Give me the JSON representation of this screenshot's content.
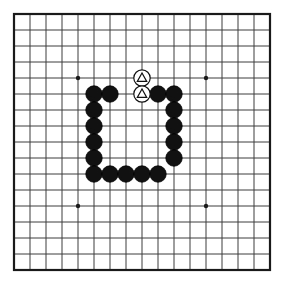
{
  "figure": {
    "kind": "go-board-diagram",
    "background_color": "#ffffff"
  },
  "board": {
    "columns": 17,
    "rows": 17,
    "origin_x": 14,
    "origin_y": 14,
    "spacing": 16,
    "line_color": "#3c3c3c",
    "line_width": 1,
    "border_color": "#1a1a1a",
    "border_width": 2.2,
    "star_point_color": "#1a1a1a",
    "star_point_radius": 2.2,
    "star_points": [
      {
        "col": 4,
        "row": 4
      },
      {
        "col": 12,
        "row": 4
      },
      {
        "col": 4,
        "row": 12
      },
      {
        "col": 12,
        "row": 12
      }
    ]
  },
  "stones": {
    "radius": 8.2,
    "black_fill": "#111111",
    "black_edge": "#000000",
    "white_fill": "#ffffff",
    "white_edge": "#111111",
    "white_edge_width": 1.2,
    "black": [
      {
        "col": 5,
        "row": 5
      },
      {
        "col": 6,
        "row": 5
      },
      {
        "col": 9,
        "row": 5
      },
      {
        "col": 10,
        "row": 5
      },
      {
        "col": 5,
        "row": 6
      },
      {
        "col": 10,
        "row": 6
      },
      {
        "col": 5,
        "row": 7
      },
      {
        "col": 10,
        "row": 7
      },
      {
        "col": 5,
        "row": 8
      },
      {
        "col": 10,
        "row": 8
      },
      {
        "col": 5,
        "row": 9
      },
      {
        "col": 10,
        "row": 9
      },
      {
        "col": 5,
        "row": 10
      },
      {
        "col": 6,
        "row": 10
      },
      {
        "col": 7,
        "row": 10
      },
      {
        "col": 8,
        "row": 10
      },
      {
        "col": 9,
        "row": 10
      }
    ],
    "white": [
      {
        "col": 8,
        "row": 4,
        "mark": "triangle"
      },
      {
        "col": 8,
        "row": 5,
        "mark": "triangle"
      }
    ]
  },
  "marks": {
    "triangle_color": "#111111",
    "triangle_width": 1.2,
    "triangle_size": 9.4
  },
  "counts": {
    "black_stones": "17",
    "white_stones": "2",
    "marked_stones": "2"
  }
}
